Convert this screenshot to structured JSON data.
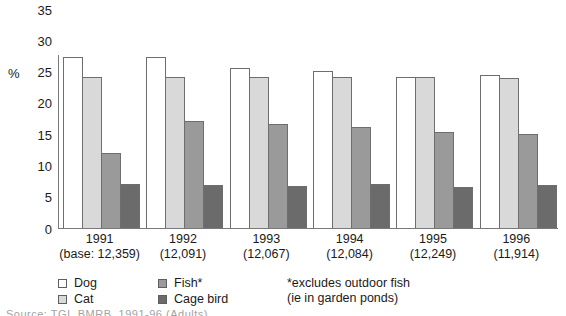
{
  "chart_data": {
    "type": "bar",
    "title": "",
    "xlabel": "",
    "ylabel": "%",
    "ylim": [
      0,
      35
    ],
    "yticks": [
      35,
      30,
      25,
      20,
      15,
      10,
      5,
      0
    ],
    "grid": false,
    "legend_position": "bottom-left",
    "categories": [
      "1991",
      "1992",
      "1993",
      "1994",
      "1995",
      "1996"
    ],
    "category_sublabels": [
      "(base: 12,359)",
      "(12,091)",
      "(12,067)",
      "(12,084)",
      "(12,249)",
      "(11,914)"
    ],
    "series": [
      {
        "name": "Dog",
        "color": "#ffffff",
        "values": [
          27.4,
          27.4,
          25.6,
          25.1,
          24.2,
          24.5
        ]
      },
      {
        "name": "Cat",
        "color": "#d9d9d9",
        "values": [
          24.2,
          24.2,
          24.2,
          24.2,
          24.2,
          24.0
        ]
      },
      {
        "name": "Fish*",
        "color": "#9a9a9a",
        "values": [
          12.0,
          17.1,
          16.7,
          16.1,
          15.4,
          15.0
        ]
      },
      {
        "name": "Cage bird",
        "color": "#6b6b6b",
        "values": [
          7.1,
          6.9,
          6.7,
          7.0,
          6.6,
          6.9
        ]
      }
    ],
    "annotations": [
      "*excludes outdoor fish",
      "(ie in garden ponds)"
    ]
  },
  "axis": {
    "y_unit_label": "%",
    "ticks": [
      "35",
      "30",
      "25",
      "20",
      "15",
      "10",
      "5",
      "0"
    ]
  },
  "legend": {
    "items": [
      {
        "label": "Dog"
      },
      {
        "label": "Cat"
      },
      {
        "label": "Fish*"
      },
      {
        "label": "Cage bird"
      }
    ]
  },
  "footnote": {
    "line1": "*excludes outdoor fish",
    "line2": "(ie in garden ponds)"
  },
  "source": {
    "text": "Source:   TGI, BMRB, 1991-96 (Adults)"
  }
}
